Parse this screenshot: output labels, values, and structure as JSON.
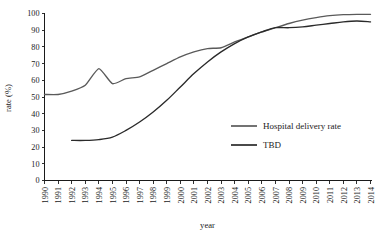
{
  "chart_data": {
    "type": "line",
    "title": "",
    "xlabel": "year",
    "ylabel": "rate (%)",
    "xlim": [
      1990,
      2014
    ],
    "ylim": [
      0,
      100
    ],
    "grid": false,
    "legend_position": "center-right",
    "x": [
      1990,
      1991,
      1992,
      1993,
      1994,
      1995,
      1996,
      1997,
      1998,
      1999,
      2000,
      2001,
      2002,
      2003,
      2004,
      2005,
      2006,
      2007,
      2008,
      2009,
      2010,
      2011,
      2012,
      2013,
      2014
    ],
    "categories": [
      "1990",
      "1991",
      "1992",
      "1993",
      "1994",
      "1995",
      "1996",
      "1997",
      "1998",
      "1999",
      "2000",
      "2001",
      "2002",
      "2003",
      "2004",
      "2005",
      "2006",
      "2007",
      "2008",
      "2009",
      "2010",
      "2011",
      "2012",
      "2013",
      "2014"
    ],
    "yticks": [
      0,
      10,
      20,
      30,
      40,
      50,
      60,
      70,
      80,
      90,
      100
    ],
    "series": [
      {
        "name": "Hospital delivery rate",
        "color": "#5a5a5a",
        "x": [
          1990,
          1991,
          1992,
          1993,
          1994,
          1995,
          1996,
          1997,
          1998,
          1999,
          2000,
          2001,
          2002,
          2003,
          2004,
          2005,
          2006,
          2007,
          2008,
          2009,
          2010,
          2011,
          2012,
          2013,
          2014
        ],
        "values": [
          51.5,
          51.5,
          53.5,
          57,
          67,
          58,
          61,
          62,
          66,
          70,
          74,
          77,
          79,
          79.5,
          83,
          86,
          89,
          91.5,
          94,
          96,
          97.5,
          98.7,
          99.3,
          99.5,
          99.5
        ]
      },
      {
        "name": "TBD",
        "color": "#2a2a2a",
        "x": [
          1992,
          1993,
          1994,
          1995,
          1996,
          1997,
          1998,
          1999,
          2000,
          2001,
          2002,
          2003,
          2004,
          2005,
          2006,
          2007,
          2008,
          2009,
          2010,
          2011,
          2012,
          2013,
          2014
        ],
        "values": [
          24,
          24,
          24.5,
          26,
          30,
          35,
          41,
          48,
          56,
          64,
          71,
          77,
          82,
          86,
          89,
          91.5,
          91.5,
          92,
          93,
          94,
          95,
          95.5,
          95
        ]
      }
    ]
  },
  "legend": {
    "items": [
      {
        "label": "Hospital delivery rate",
        "color": "#5a5a5a"
      },
      {
        "label": "TBD",
        "color": "#2a2a2a"
      }
    ]
  },
  "axes": {
    "y_title": "rate (%)",
    "x_title": "year"
  }
}
